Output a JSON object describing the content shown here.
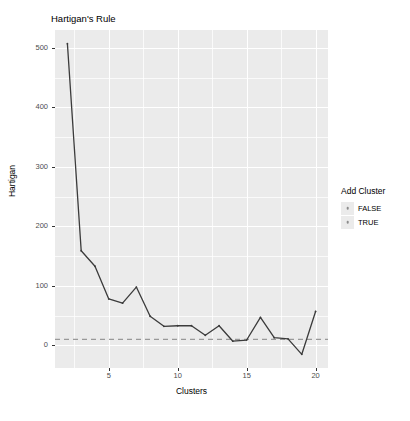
{
  "chart_data": {
    "type": "line",
    "title": "Hartigan's Rule",
    "xlabel": "Clusters",
    "ylabel": "Hartigan",
    "grid": true,
    "xlim": [
      1.1,
      20.9
    ],
    "ylim": [
      -38,
      530
    ],
    "xticks": [
      5,
      10,
      15,
      20
    ],
    "yticks": [
      0,
      100,
      200,
      300,
      400,
      500
    ],
    "x": [
      2,
      3,
      4,
      5,
      6,
      7,
      8,
      9,
      10,
      11,
      12,
      13,
      14,
      15,
      16,
      17,
      18,
      19,
      20
    ],
    "values": [
      507,
      159,
      133,
      78,
      71,
      98,
      49,
      32,
      33,
      33,
      17,
      33,
      7,
      9,
      47,
      13,
      11,
      -15,
      57
    ],
    "point_add_cluster": [
      true,
      true,
      true,
      true,
      true,
      true,
      true,
      true,
      true,
      true,
      true,
      true,
      false,
      false,
      true,
      true,
      true,
      false,
      true
    ],
    "reference_line": {
      "y": 10,
      "style": "dashed",
      "color": "#999999"
    },
    "line_color": "#3b3b3b",
    "series_name": "Hartigan",
    "legend": {
      "position": "right",
      "title": "Add Cluster",
      "entries": [
        {
          "label": "FALSE",
          "color": "#f8766d"
        },
        {
          "label": "TRUE",
          "color": "#00bfc4"
        }
      ]
    }
  },
  "plot": {
    "title": "Hartigan's Rule",
    "axis_x_title": "Clusters",
    "axis_y_title": "Hartigan",
    "x_tick_labels": [
      "5",
      "10",
      "15",
      "20"
    ],
    "y_tick_labels": [
      "0",
      "100",
      "200",
      "300",
      "400",
      "500"
    ]
  },
  "legend": {
    "title": "Add Cluster",
    "items": [
      {
        "label": "FALSE"
      },
      {
        "label": "TRUE"
      }
    ]
  },
  "theme": {
    "panel_fill": "#ebebeb",
    "grid_color": "#ffffff",
    "line_color": "#3b3b3b",
    "reference_color": "#999999",
    "text_color": "#000000",
    "tick_color": "#4d4d4d"
  }
}
